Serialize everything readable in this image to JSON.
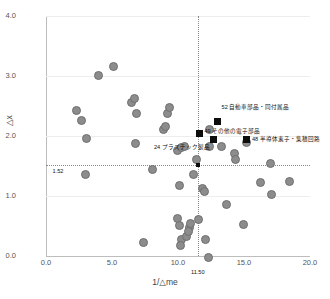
{
  "chart_data": {
    "type": "scatter",
    "title": "",
    "xlabel": "1/△me",
    "ylabel": "△x",
    "xlim": [
      0.0,
      20.0
    ],
    "ylim": [
      0.0,
      4.0
    ],
    "xticks": [
      "0.0",
      "5.0",
      "10.0",
      "15.0",
      "20.0"
    ],
    "xtick_values": [
      0.0,
      5.0,
      10.0,
      15.0,
      20.0
    ],
    "yticks": [
      "0.0",
      "1.0",
      "2.0",
      "3.0",
      "4.0"
    ],
    "ytick_values": [
      0.0,
      1.0,
      2.0,
      3.0,
      4.0
    ],
    "grid": "horizontal",
    "legend": "none",
    "reference_lines": {
      "horizontal": {
        "value": 1.52,
        "label": "1.52",
        "style": "dotted"
      },
      "vertical": {
        "value": 11.5,
        "label": "11.50",
        "style": "dotted"
      }
    },
    "series": [
      {
        "name": "unlabeled-industries",
        "marker": "circle",
        "color": "#8c8c8c",
        "points": [
          [
            2.2,
            2.45
          ],
          [
            2.6,
            2.27
          ],
          [
            3.0,
            1.98
          ],
          [
            2.9,
            1.38
          ],
          [
            3.9,
            3.02
          ],
          [
            5.0,
            3.18
          ],
          [
            6.4,
            2.58
          ],
          [
            6.6,
            2.64
          ],
          [
            6.8,
            2.4
          ],
          [
            6.7,
            1.9
          ],
          [
            7.3,
            0.24
          ],
          [
            8.0,
            1.46
          ],
          [
            8.8,
            2.13
          ],
          [
            9.0,
            2.17
          ],
          [
            9.1,
            2.4
          ],
          [
            9.3,
            2.5
          ],
          [
            9.9,
            1.78
          ],
          [
            10.2,
            1.82
          ],
          [
            10.4,
            1.84
          ],
          [
            10.0,
            1.2
          ],
          [
            9.9,
            0.64
          ],
          [
            10.0,
            0.52
          ],
          [
            10.2,
            0.3
          ],
          [
            10.1,
            0.19
          ],
          [
            10.6,
            0.34
          ],
          [
            10.8,
            0.5
          ],
          [
            10.7,
            0.42
          ],
          [
            10.9,
            0.56
          ],
          [
            11.1,
            1.38
          ],
          [
            11.3,
            1.62
          ],
          [
            11.5,
            0.63
          ],
          [
            11.8,
            1.15
          ],
          [
            11.9,
            1.1
          ],
          [
            12.0,
            0.3
          ],
          [
            12.2,
            0.0
          ],
          [
            12.3,
            2.12
          ],
          [
            12.3,
            1.85
          ],
          [
            13.2,
            1.84
          ],
          [
            13.6,
            0.88
          ],
          [
            14.2,
            1.72
          ],
          [
            14.3,
            1.62
          ],
          [
            14.9,
            0.54
          ],
          [
            15.1,
            1.91
          ],
          [
            16.2,
            1.24
          ],
          [
            16.9,
            1.56
          ],
          [
            17.0,
            1.05
          ],
          [
            18.4,
            1.26
          ]
        ]
      },
      {
        "name": "highlighted-industries",
        "marker": "square",
        "color": "#0d0d0d",
        "points": [
          {
            "x": 13.0,
            "y": 2.25,
            "label": "52 自動車部品・同付属品"
          },
          {
            "x": 11.6,
            "y": 2.05,
            "label": "49 その他の電子部品"
          },
          {
            "x": 12.7,
            "y": 1.95,
            "label": "24 プラスチック製品"
          },
          {
            "x": 15.2,
            "y": 1.94,
            "label": "48 半導体素子・集積回路"
          }
        ]
      },
      {
        "name": "origin-threshold-marker",
        "marker": "square-small",
        "color": "#0d0d0d",
        "points": [
          [
            11.5,
            1.52
          ]
        ]
      }
    ],
    "annotations": [
      {
        "text": "52 自動車部品・同付属品",
        "x": 13.3,
        "y": 2.47,
        "anchor": "left"
      },
      {
        "text": "49 その他の電子部品",
        "x": 12.0,
        "y": 2.06,
        "anchor": "left"
      },
      {
        "text": "24 プラスチック製品",
        "x": 12.4,
        "y": 1.8,
        "anchor": "right"
      },
      {
        "text": "48 半導体素子・集積回路",
        "x": 15.6,
        "y": 1.93,
        "anchor": "left"
      },
      {
        "text": "1.52",
        "x": 0.5,
        "y": 1.4,
        "anchor": "left"
      },
      {
        "text": "11.50",
        "x": 11.5,
        "y": -0.28,
        "anchor": "center"
      }
    ]
  }
}
